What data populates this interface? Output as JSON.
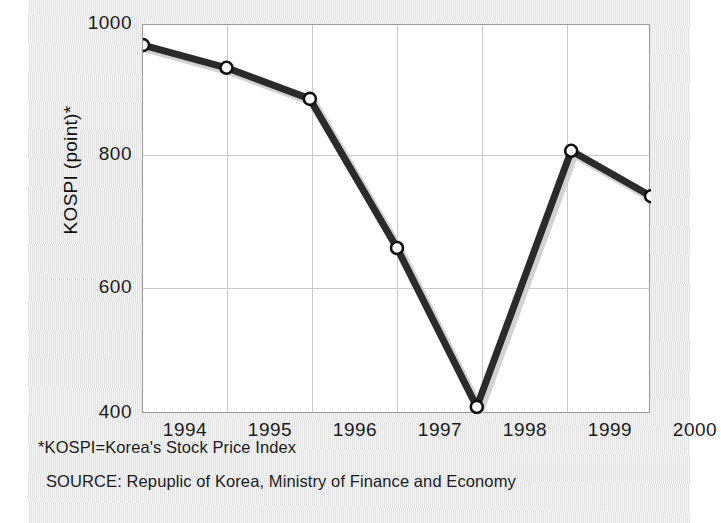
{
  "chart_data": {
    "type": "line",
    "title": "",
    "xlabel": "",
    "ylabel": "KOSPI (point)*",
    "xlim": [
      1993.5,
      2000.5
    ],
    "ylim": [
      400,
      1000
    ],
    "grid": true,
    "legend": "none",
    "marker": "open-circle",
    "line_color": "#2b2b2b",
    "x_tick_labels": [
      "1994",
      "1995",
      "1996",
      "1997",
      "1998",
      "1999",
      "2000"
    ],
    "y_tick_labels": [
      "1000",
      "800",
      "600",
      "400"
    ],
    "y_ticks": [
      1000,
      800,
      600,
      400
    ],
    "x": [
      1993.5,
      1994.65,
      1995.8,
      1997.0,
      1998.1,
      1999.4,
      2000.5
    ],
    "values": [
      969,
      934,
      886,
      656,
      411,
      806,
      736
    ],
    "series": [
      {
        "name": "KOSPI",
        "values": [
          969,
          934,
          886,
          656,
          411,
          806,
          736
        ]
      }
    ],
    "annotations": [
      "*KOSPI=Korea's Stock Price Index",
      "SOURCE: Repuplic of Korea, Ministry of Finance and Economy"
    ]
  },
  "axis": {
    "y_title": "KOSPI (point)*",
    "y_ticks": [
      {
        "label": "1000"
      },
      {
        "label": "800"
      },
      {
        "label": "600"
      },
      {
        "label": "400"
      }
    ],
    "x_ticks": [
      {
        "label": "1994"
      },
      {
        "label": "1995"
      },
      {
        "label": "1996"
      },
      {
        "label": "1997"
      },
      {
        "label": "1998"
      },
      {
        "label": "1999"
      },
      {
        "label": "2000"
      }
    ]
  },
  "notes": {
    "footnote": "*KOSPI=Korea's Stock Price Index",
    "source": "SOURCE: Repuplic of Korea, Ministry of Finance and Economy"
  },
  "colors": {
    "line": "#2b2b2b",
    "marker_fill": "#ffffff",
    "grid": "#c9c9c9",
    "frame": "#9a9a9a",
    "panel_bg": "#ebebec",
    "plot_bg": "#ffffff",
    "text": "#1c1c1c"
  }
}
